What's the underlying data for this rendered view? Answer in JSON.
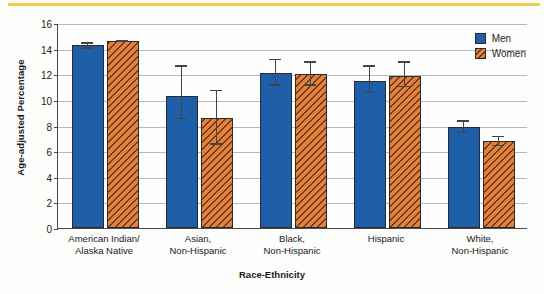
{
  "chart_data": {
    "type": "bar",
    "title": "",
    "xlabel": "Race-Ethnicity",
    "ylabel": "Age-adjusted Percentage",
    "ylim": [
      0,
      16
    ],
    "ytick_step": 2,
    "yticks": [
      0,
      2,
      4,
      6,
      8,
      10,
      12,
      14,
      16
    ],
    "grid": true,
    "legend_position": "top-right",
    "categories": [
      "American Indian/\nAlaska Native",
      "Asian,\nNon-Hispanic",
      "Black,\nNon-Hispanic",
      "Hispanic",
      "White,\nNon-Hispanic"
    ],
    "category_lines": [
      [
        "American Indian/",
        "Alaska Native"
      ],
      [
        "Asian,",
        "Non-Hispanic"
      ],
      [
        "Black,",
        "Non-Hispanic"
      ],
      [
        "Hispanic",
        ""
      ],
      [
        "White,",
        "Non-Hispanic"
      ]
    ],
    "series": [
      {
        "name": "Men",
        "color": "#1f5fa9",
        "values": [
          14.3,
          10.3,
          12.1,
          11.5,
          7.9
        ],
        "ci_low": [
          14.0,
          8.5,
          11.1,
          10.5,
          7.4
        ],
        "ci_high": [
          14.5,
          12.7,
          13.2,
          12.7,
          8.4
        ]
      },
      {
        "name": "Women",
        "color": "#e3813f",
        "values": [
          14.6,
          8.6,
          12.0,
          11.9,
          6.8
        ],
        "ci_low": [
          14.5,
          6.5,
          11.1,
          11.0,
          6.4
        ],
        "ci_high": [
          14.7,
          10.8,
          13.0,
          13.0,
          7.2
        ]
      }
    ]
  },
  "legend": {
    "items": [
      {
        "label": "Men",
        "swatch": "men"
      },
      {
        "label": "Women",
        "swatch": "women"
      }
    ]
  },
  "axes": {
    "y_title": "Age-adjusted Percentage",
    "x_title": "Race-Ethnicity"
  }
}
